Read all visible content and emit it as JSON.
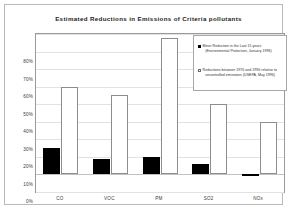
{
  "chart_data": {
    "type": "bar",
    "title": "Estimated Reductions in Emissions of Criteria pollutants",
    "xlabel": "",
    "ylabel": "",
    "categories": [
      "CO",
      "VOC",
      "PM",
      "SO2",
      "NOx"
    ],
    "series": [
      {
        "name": "Minor Reduction in the Last 15 years (Environmental Protection, January 1996)",
        "name_line1": "Minor Reduction in the Last 15 years",
        "name_line2": "(Environmental Protection, January 1996)",
        "color": "#000000",
        "style": "filled",
        "values": [
          15,
          9,
          10,
          6,
          -1
        ]
      },
      {
        "name": "Reductions between 1970 and 1990 relative to uncontrolled emissions (USEPA, May 1996)",
        "name_line1": "Reductions between 1970 and 1990 relative to",
        "name_line2": "uncontrolled emissions (USEPA, May 1996)",
        "color": "#ffffff",
        "style": "outlined",
        "values": [
          50,
          45,
          78,
          40,
          30
        ]
      }
    ],
    "ylim": [
      -10,
      80
    ],
    "ytick_step": 10,
    "ytick_labels": [
      "80%",
      "70%",
      "60%",
      "50%",
      "40%",
      "30%",
      "20%",
      "10%",
      "0%",
      "-10%"
    ],
    "ytick_values": [
      80,
      70,
      60,
      50,
      40,
      30,
      20,
      10,
      0,
      -10
    ],
    "grid": true,
    "legend_position": "top-right",
    "value_suffix": "%"
  },
  "colors": {
    "series_dark": "#000000",
    "series_light": "#ffffff",
    "outline": "#8d8d8d",
    "grid": "#e2e2e2",
    "frame": "#b9b9b9",
    "text": "#2e2e2e"
  }
}
